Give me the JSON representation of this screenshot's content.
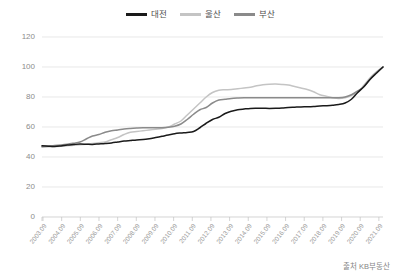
{
  "source_note": "출처 KB부동산",
  "legend": {
    "position": "top-center",
    "items": [
      {
        "label": "대전",
        "color": "#1a1a1a",
        "name": "legend-daejeon"
      },
      {
        "label": "울산",
        "color": "#c4c4c4",
        "name": "legend-ulsan"
      },
      {
        "label": "부산",
        "color": "#8a8a8a",
        "name": "legend-busan"
      }
    ]
  },
  "chart_data": {
    "type": "line",
    "title": "",
    "subtitle": "",
    "xlabel": "",
    "ylabel": "",
    "ylim": [
      0,
      120
    ],
    "ytick_values": [
      0,
      20,
      40,
      60,
      80,
      100,
      120
    ],
    "ytick_labels": [
      "0",
      "20",
      "40",
      "60",
      "80",
      "100",
      "120"
    ],
    "grid": true,
    "legend_position": "top-center",
    "x_tick_labels": [
      "2003.09",
      "2004.09",
      "2005.09",
      "2006.09",
      "2007.09",
      "2008.09",
      "2009.09",
      "2010.09",
      "2011.09",
      "2012.09",
      "2013.09",
      "2014.09",
      "2015.09",
      "2016.09",
      "2017.09",
      "2018.09",
      "2019.09",
      "2020.09",
      "2021.09"
    ],
    "x": [
      2003.75,
      2004.75,
      2005.75,
      2006.75,
      2007.75,
      2008.75,
      2009.75,
      2010.75,
      2011.75,
      2012.75,
      2013.75,
      2014.75,
      2015.75,
      2016.75,
      2017.75,
      2018.75,
      2019.75,
      2020.75,
      2021.75
    ],
    "series": [
      {
        "name": "대전",
        "color": "#1a1a1a",
        "values": [
          47.5,
          48.5,
          49.0,
          50.5,
          51.5,
          53.0,
          55.5,
          57.0,
          66.5,
          71.5,
          72.5,
          72.5,
          73.0,
          73.5,
          74.0,
          74.5,
          76.0,
          87.0,
          100.0
        ],
        "monthly": [
          47.5,
          47.2,
          47.0,
          47.4,
          48.0,
          48.3,
          48.6,
          48.5,
          48.4,
          48.7,
          49.0,
          49.4,
          50.0,
          50.6,
          51.0,
          51.4,
          51.6,
          52.2,
          53.0,
          53.8,
          54.6,
          55.5,
          56.0,
          56.4,
          57.0,
          59.5,
          62.5,
          65.0,
          66.5,
          69.0,
          70.5,
          71.5,
          72.0,
          72.4,
          72.5,
          72.5,
          72.4,
          72.5,
          72.7,
          73.0,
          73.2,
          73.4,
          73.5,
          73.7,
          74.0,
          74.2,
          74.5,
          75.0,
          76.0,
          78.5,
          83.0,
          87.0,
          92.0,
          96.0,
          100.0
        ]
      },
      {
        "name": "울산",
        "color": "#c4c4c4",
        "values": [
          46.5,
          47.5,
          48.5,
          50.0,
          53.0,
          57.0,
          58.5,
          62.0,
          76.0,
          84.5,
          85.0,
          86.5,
          88.5,
          88.0,
          85.0,
          81.5,
          79.0,
          83.0,
          100.0
        ],
        "monthly": [
          46.5,
          46.8,
          47.0,
          47.2,
          47.5,
          47.8,
          48.2,
          48.5,
          49.0,
          49.5,
          50.0,
          51.5,
          53.0,
          55.0,
          56.5,
          57.0,
          57.5,
          58.0,
          58.5,
          59.0,
          60.0,
          62.0,
          64.0,
          68.0,
          72.0,
          76.0,
          80.0,
          83.0,
          84.5,
          84.8,
          85.0,
          85.5,
          86.0,
          86.5,
          87.5,
          88.2,
          88.5,
          88.6,
          88.4,
          88.0,
          87.0,
          86.0,
          85.0,
          83.5,
          81.5,
          80.5,
          79.5,
          79.0,
          79.5,
          81.0,
          83.0,
          88.0,
          93.0,
          97.0,
          100.0
        ]
      },
      {
        "name": "부산",
        "color": "#8a8a8a",
        "values": [
          47.0,
          48.0,
          50.0,
          55.0,
          58.0,
          59.5,
          59.5,
          62.0,
          73.0,
          78.5,
          79.5,
          79.5,
          79.5,
          79.5,
          79.5,
          79.5,
          79.5,
          87.0,
          100.0
        ],
        "monthly": [
          47.0,
          47.3,
          47.6,
          48.0,
          48.5,
          49.2,
          50.0,
          52.0,
          54.0,
          55.0,
          56.5,
          57.5,
          58.0,
          58.6,
          59.0,
          59.3,
          59.5,
          59.5,
          59.5,
          59.5,
          59.8,
          60.5,
          62.0,
          65.0,
          68.5,
          71.5,
          73.0,
          76.0,
          78.0,
          78.5,
          79.0,
          79.3,
          79.5,
          79.5,
          79.5,
          79.5,
          79.5,
          79.5,
          79.5,
          79.5,
          79.5,
          79.5,
          79.5,
          79.5,
          79.5,
          79.5,
          79.5,
          79.5,
          80.0,
          81.5,
          84.0,
          87.0,
          92.0,
          96.5,
          100.0
        ]
      }
    ]
  }
}
